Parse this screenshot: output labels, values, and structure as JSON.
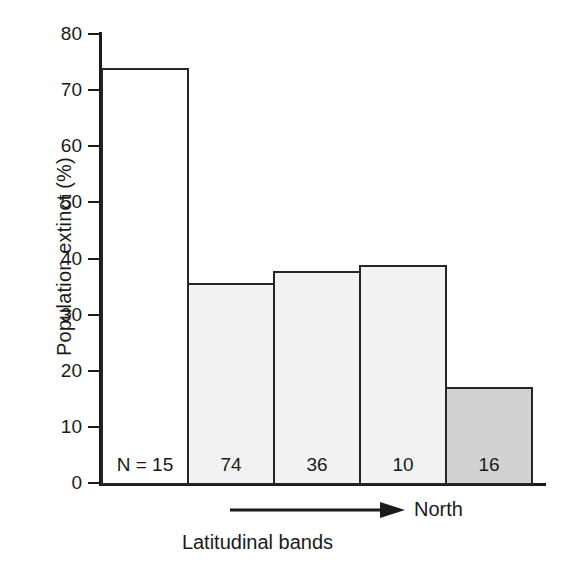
{
  "chart_data": {
    "type": "bar",
    "title": "",
    "subtitle": "",
    "xlabel": "Latitudinal bands",
    "ylabel": "Population extinct (%)",
    "ylim": [
      0,
      80
    ],
    "yticks": [
      0,
      10,
      20,
      30,
      40,
      50,
      60,
      70,
      80
    ],
    "ytick_labels": [
      "0",
      "10",
      "20",
      "30",
      "40",
      "50",
      "60",
      "70",
      "80"
    ],
    "grid": false,
    "legend": null,
    "categories": [
      "Band 1",
      "Band 2",
      "Band 3",
      "Band 4",
      "Band 5"
    ],
    "values": [
      74,
      35.7,
      37.7,
      38.8,
      17.1
    ],
    "bar_labels": [
      "N = 15",
      "74",
      "36",
      "10",
      "16"
    ],
    "sample_sizes": [
      15,
      74,
      36,
      10,
      16
    ],
    "bar_fills": [
      "#ffffff",
      "#f2f2f2",
      "#f2f2f2",
      "#f2f2f2",
      "#d2d2d2"
    ],
    "bar_edge_color": "#262626",
    "annotations": [
      {
        "name": "direction-arrow",
        "text": "North",
        "direction": "right"
      }
    ]
  },
  "axes": {
    "y_title": "Population extinct (%)",
    "x_title": "Latitudinal bands",
    "y_ticks": [
      {
        "label": "80",
        "value": 80
      },
      {
        "label": "70",
        "value": 70
      },
      {
        "label": "60",
        "value": 60
      },
      {
        "label": "50",
        "value": 50
      },
      {
        "label": "40",
        "value": 40
      },
      {
        "label": "30",
        "value": 30
      },
      {
        "label": "20",
        "value": 20
      },
      {
        "label": "10",
        "value": 10
      },
      {
        "label": "0",
        "value": 0
      }
    ]
  },
  "bars": [
    {
      "label": "N = 15",
      "value": 74
    },
    {
      "label": "74",
      "value": 35.7
    },
    {
      "label": "36",
      "value": 37.7
    },
    {
      "label": "10",
      "value": 38.8
    },
    {
      "label": "16",
      "value": 17.1
    }
  ],
  "annotation": {
    "north_label": "North"
  },
  "colors": {
    "ink": "#1a1a1a",
    "bar_edge": "#262626",
    "bar_white": "#ffffff",
    "bar_light_gray": "#f2f2f2",
    "bar_dark_gray": "#d2d2d2",
    "background": "#ffffff"
  }
}
